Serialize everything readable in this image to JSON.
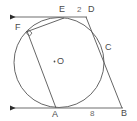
{
  "figure": {
    "type": "geometry-diagram",
    "background_color": "#ffffff",
    "stroke_color": "#555555",
    "label_color": "#4a4a4a"
  },
  "labels": {
    "E": "E",
    "D": "D",
    "F": "F",
    "C": "C",
    "O": "O",
    "A": "A",
    "B": "B"
  },
  "measures": {
    "ED": "2",
    "AB": "8"
  },
  "marks": {
    "center_dot": ".",
    "right_angle_at_F": "right-angle"
  },
  "geometry": {
    "circle": {
      "cx": 59,
      "cy": 62.5,
      "r": 45
    },
    "points": {
      "A": {
        "x": 55,
        "y": 108
      },
      "B": {
        "x": 122,
        "y": 108
      },
      "C": {
        "x": 102,
        "y": 53
      },
      "D": {
        "x": 86,
        "y": 17
      },
      "E": {
        "x": 63,
        "y": 18
      },
      "F": {
        "x": 28,
        "y": 30
      },
      "O": {
        "x": 59,
        "y": 62.5
      }
    },
    "top_ray": {
      "x1": 86,
      "y1": 17,
      "x2": 6,
      "y2": 17,
      "arrow": "left"
    },
    "bottom_ray": {
      "x1": 122,
      "y1": 108,
      "x2": 6,
      "y2": 108,
      "arrow": "left"
    }
  }
}
